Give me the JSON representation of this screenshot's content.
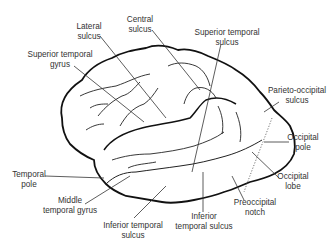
{
  "diagram": {
    "title": "",
    "colors": {
      "outline": "#111111",
      "sulci": "#222222",
      "leader": "#333333",
      "text": "#333333"
    },
    "labels": [
      {
        "id": "lateral-sulcus",
        "line1": "Lateral",
        "line2": "sulcus",
        "x": 89,
        "y": 22
      },
      {
        "id": "central-sulcus",
        "line1": "Central",
        "line2": "sulcus",
        "x": 140,
        "y": 15
      },
      {
        "id": "superior-temporal-gyrus",
        "line1": "Superior temporal",
        "line2": "gyrus",
        "x": 60,
        "y": 50
      },
      {
        "id": "superior-temporal-sulcus",
        "line1": "Superior temporal",
        "line2": "sulcus",
        "x": 227,
        "y": 28
      },
      {
        "id": "parieto-occipital-sulcus",
        "line1": "Parieto-occipital",
        "line2": "sulcus",
        "x": 297,
        "y": 86
      },
      {
        "id": "occipital-pole",
        "line1": "Occipital",
        "line2": "pole",
        "x": 303,
        "y": 133
      },
      {
        "id": "temporal-pole",
        "line1": "Temporal",
        "line2": "pole",
        "x": 29,
        "y": 170
      },
      {
        "id": "occipital-lobe",
        "line1": "Occipital",
        "line2": "lobe",
        "x": 293,
        "y": 172
      },
      {
        "id": "middle-temporal-gyrus",
        "line1": "Middle",
        "line2": "temporal gyrus",
        "x": 70,
        "y": 196
      },
      {
        "id": "preoccipital-notch",
        "line1": "Preoccipital",
        "line2": "notch",
        "x": 255,
        "y": 198
      },
      {
        "id": "inferior-temporal-sulcus-left",
        "line1": "Inferior temporal",
        "line2": "sulcus",
        "x": 133,
        "y": 221
      },
      {
        "id": "inferior-temporal-sulcus-right",
        "line1": "Inferior",
        "line2": "temporal sulcus",
        "x": 204,
        "y": 212
      }
    ]
  }
}
